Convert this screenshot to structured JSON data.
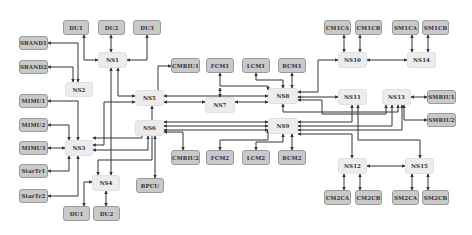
{
  "diagram": {
    "type": "network-topology",
    "colors": {
      "leaf_fill": "#c9c9c9",
      "switch_fill": "#ececec",
      "line": "#333333"
    },
    "nodes": [
      {
        "id": "DU1_top",
        "label": "DU1",
        "kind": "leaf",
        "x": 63,
        "y": 20,
        "w": 26,
        "h": 15
      },
      {
        "id": "DU2_top",
        "label": "DU2",
        "kind": "leaf",
        "x": 98,
        "y": 20,
        "w": 27,
        "h": 15
      },
      {
        "id": "DU3",
        "label": "DU3",
        "kind": "leaf",
        "x": 133,
        "y": 20,
        "w": 28,
        "h": 15
      },
      {
        "id": "SBAND1",
        "label": "SBAND1",
        "kind": "leaf",
        "x": 19,
        "y": 36,
        "w": 29,
        "h": 14
      },
      {
        "id": "SBAND2",
        "label": "SBAND2",
        "kind": "leaf",
        "x": 19,
        "y": 60,
        "w": 29,
        "h": 14
      },
      {
        "id": "NS1",
        "label": "NS1",
        "kind": "ns",
        "x": 98,
        "y": 52,
        "w": 29,
        "h": 16
      },
      {
        "id": "NS2",
        "label": "NS2",
        "kind": "ns",
        "x": 65,
        "y": 82,
        "w": 28,
        "h": 15
      },
      {
        "id": "MIMU1",
        "label": "MIMU1",
        "kind": "leaf",
        "x": 19,
        "y": 94,
        "w": 29,
        "h": 14
      },
      {
        "id": "MIMU2",
        "label": "MIMU2",
        "kind": "leaf",
        "x": 19,
        "y": 118,
        "w": 29,
        "h": 14
      },
      {
        "id": "MIMU3",
        "label": "MIMU3",
        "kind": "leaf",
        "x": 19,
        "y": 141,
        "w": 29,
        "h": 14
      },
      {
        "id": "StarTr1",
        "label": "StarTr1",
        "kind": "leaf",
        "x": 19,
        "y": 164,
        "w": 29,
        "h": 14
      },
      {
        "id": "StarTr2",
        "label": "StarTr2",
        "kind": "leaf",
        "x": 19,
        "y": 189,
        "w": 29,
        "h": 14
      },
      {
        "id": "NS3",
        "label": "NS3",
        "kind": "ns",
        "x": 65,
        "y": 140,
        "w": 28,
        "h": 16
      },
      {
        "id": "NS4",
        "label": "NS4",
        "kind": "ns",
        "x": 92,
        "y": 175,
        "w": 28,
        "h": 16
      },
      {
        "id": "DU1_bot",
        "label": "DU1",
        "kind": "leaf",
        "x": 63,
        "y": 206,
        "w": 27,
        "h": 15
      },
      {
        "id": "DU2_bot",
        "label": "DU2",
        "kind": "leaf",
        "x": 93,
        "y": 206,
        "w": 27,
        "h": 15
      },
      {
        "id": "NS5",
        "label": "NS5",
        "kind": "ns",
        "x": 135,
        "y": 90,
        "w": 29,
        "h": 16
      },
      {
        "id": "NS6",
        "label": "NS6",
        "kind": "ns",
        "x": 135,
        "y": 120,
        "w": 29,
        "h": 16
      },
      {
        "id": "BPCU",
        "label": "BPCU",
        "kind": "leaf",
        "x": 136,
        "y": 178,
        "w": 28,
        "h": 15
      },
      {
        "id": "CMRIU1",
        "label": "CMRIU1",
        "kind": "leaf",
        "x": 171,
        "y": 58,
        "w": 29,
        "h": 15
      },
      {
        "id": "CMRIU2",
        "label": "CMRIU2",
        "kind": "leaf",
        "x": 171,
        "y": 150,
        "w": 29,
        "h": 15
      },
      {
        "id": "FCM1",
        "label": "FCM1",
        "kind": "leaf",
        "x": 206,
        "y": 58,
        "w": 28,
        "h": 15
      },
      {
        "id": "LCM1",
        "label": "LCM1",
        "kind": "leaf",
        "x": 242,
        "y": 58,
        "w": 28,
        "h": 15
      },
      {
        "id": "RCM1",
        "label": "RCM1",
        "kind": "leaf",
        "x": 278,
        "y": 58,
        "w": 28,
        "h": 15
      },
      {
        "id": "NS7",
        "label": "NS7",
        "kind": "ns",
        "x": 205,
        "y": 97,
        "w": 30,
        "h": 16
      },
      {
        "id": "NS8",
        "label": "NS8",
        "kind": "ns",
        "x": 268,
        "y": 88,
        "w": 30,
        "h": 16
      },
      {
        "id": "NS9",
        "label": "NS9",
        "kind": "ns",
        "x": 268,
        "y": 118,
        "w": 30,
        "h": 16
      },
      {
        "id": "FCM2",
        "label": "FCM2",
        "kind": "leaf",
        "x": 206,
        "y": 150,
        "w": 28,
        "h": 15
      },
      {
        "id": "LCM2",
        "label": "LCM2",
        "kind": "leaf",
        "x": 242,
        "y": 150,
        "w": 28,
        "h": 15
      },
      {
        "id": "RCM2",
        "label": "RCM2",
        "kind": "leaf",
        "x": 278,
        "y": 150,
        "w": 28,
        "h": 15
      },
      {
        "id": "CM1CA",
        "label": "CM1CA",
        "kind": "leaf",
        "x": 324,
        "y": 20,
        "w": 27,
        "h": 15
      },
      {
        "id": "CM1CB",
        "label": "CM1CB",
        "kind": "leaf",
        "x": 355,
        "y": 20,
        "w": 27,
        "h": 15
      },
      {
        "id": "SM1CA",
        "label": "SM1CA",
        "kind": "leaf",
        "x": 392,
        "y": 20,
        "w": 27,
        "h": 15
      },
      {
        "id": "SM1CB",
        "label": "SM1CB",
        "kind": "leaf",
        "x": 422,
        "y": 20,
        "w": 27,
        "h": 15
      },
      {
        "id": "NS10",
        "label": "NS10",
        "kind": "ns",
        "x": 338,
        "y": 52,
        "w": 29,
        "h": 16
      },
      {
        "id": "NS14",
        "label": "NS14",
        "kind": "ns",
        "x": 407,
        "y": 52,
        "w": 29,
        "h": 16
      },
      {
        "id": "NS11",
        "label": "NS11",
        "kind": "ns",
        "x": 338,
        "y": 89,
        "w": 29,
        "h": 16
      },
      {
        "id": "NS13",
        "label": "NS13",
        "kind": "ns",
        "x": 382,
        "y": 89,
        "w": 29,
        "h": 16
      },
      {
        "id": "SMRIU1",
        "label": "SMRIU1",
        "kind": "leaf",
        "x": 427,
        "y": 90,
        "w": 29,
        "h": 14
      },
      {
        "id": "SMRIU2",
        "label": "SMRIU2",
        "kind": "leaf",
        "x": 427,
        "y": 113,
        "w": 29,
        "h": 14
      },
      {
        "id": "NS12",
        "label": "NS12",
        "kind": "ns",
        "x": 338,
        "y": 158,
        "w": 29,
        "h": 16
      },
      {
        "id": "NS15",
        "label": "NS15",
        "kind": "ns",
        "x": 405,
        "y": 158,
        "w": 29,
        "h": 16
      },
      {
        "id": "CM2CA",
        "label": "CM2CA",
        "kind": "leaf",
        "x": 324,
        "y": 190,
        "w": 27,
        "h": 15
      },
      {
        "id": "CM2CB",
        "label": "CM2CB",
        "kind": "leaf",
        "x": 355,
        "y": 190,
        "w": 27,
        "h": 15
      },
      {
        "id": "SM2CA",
        "label": "SM2CA",
        "kind": "leaf",
        "x": 392,
        "y": 190,
        "w": 27,
        "h": 15
      },
      {
        "id": "SM2CB",
        "label": "SM2CB",
        "kind": "leaf",
        "x": 422,
        "y": 190,
        "w": 27,
        "h": 15
      }
    ],
    "edges": [
      {
        "points": [
          [
            84,
            35
          ],
          [
            84,
            60
          ],
          [
            98,
            60
          ]
        ]
      },
      {
        "points": [
          [
            111,
            35
          ],
          [
            111,
            52
          ]
        ]
      },
      {
        "points": [
          [
            147,
            35
          ],
          [
            147,
            60
          ],
          [
            127,
            60
          ]
        ]
      },
      {
        "points": [
          [
            48,
            43
          ],
          [
            78,
            43
          ],
          [
            78,
            82
          ]
        ]
      },
      {
        "points": [
          [
            48,
            67
          ],
          [
            73,
            67
          ],
          [
            73,
            82
          ]
        ]
      },
      {
        "points": [
          [
            48,
            101
          ],
          [
            78,
            101
          ],
          [
            78,
            140
          ]
        ]
      },
      {
        "points": [
          [
            48,
            125
          ],
          [
            69,
            125
          ],
          [
            69,
            140
          ]
        ]
      },
      {
        "points": [
          [
            48,
            148
          ],
          [
            65,
            148
          ]
        ]
      },
      {
        "points": [
          [
            48,
            171
          ],
          [
            69,
            171
          ],
          [
            69,
            156
          ]
        ]
      },
      {
        "points": [
          [
            48,
            196
          ],
          [
            78,
            196
          ],
          [
            78,
            156
          ]
        ]
      },
      {
        "points": [
          [
            84,
            206
          ],
          [
            84,
            182
          ],
          [
            92,
            182
          ]
        ]
      },
      {
        "points": [
          [
            106,
            206
          ],
          [
            106,
            191
          ]
        ]
      },
      {
        "points": [
          [
            118,
            68
          ],
          [
            118,
            96
          ],
          [
            135,
            96
          ]
        ]
      },
      {
        "points": [
          [
            111,
            68
          ],
          [
            111,
            175
          ]
        ]
      },
      {
        "points": [
          [
            93,
            145
          ],
          [
            104,
            145
          ],
          [
            104,
            102
          ],
          [
            135,
            102
          ]
        ]
      },
      {
        "points": [
          [
            93,
            150
          ],
          [
            148,
            150
          ],
          [
            148,
            136
          ]
        ]
      },
      {
        "points": [
          [
            93,
            138
          ],
          [
            142,
            138
          ],
          [
            142,
            126
          ],
          [
            135,
            126
          ]
        ]
      },
      {
        "points": [
          [
            98,
            175
          ],
          [
            98,
            160
          ],
          [
            152,
            160
          ],
          [
            152,
            106
          ]
        ]
      },
      {
        "points": [
          [
            155,
            178
          ],
          [
            155,
            136
          ]
        ]
      },
      {
        "points": [
          [
            164,
            94
          ],
          [
            158,
            94
          ],
          [
            158,
            66
          ],
          [
            171,
            66
          ]
        ]
      },
      {
        "points": [
          [
            164,
            132
          ],
          [
            183,
            132
          ],
          [
            183,
            150
          ]
        ]
      },
      {
        "points": [
          [
            164,
            96
          ],
          [
            268,
            96
          ]
        ]
      },
      {
        "points": [
          [
            164,
            102
          ],
          [
            205,
            102
          ]
        ]
      },
      {
        "points": [
          [
            164,
            122
          ],
          [
            268,
            122
          ]
        ]
      },
      {
        "points": [
          [
            164,
            126
          ],
          [
            268,
            126
          ]
        ]
      },
      {
        "points": [
          [
            164,
            130
          ],
          [
            268,
            130
          ]
        ]
      },
      {
        "points": [
          [
            235,
            102
          ],
          [
            268,
            102
          ]
        ]
      },
      {
        "points": [
          [
            220,
            73
          ],
          [
            220,
            86
          ],
          [
            268,
            86
          ],
          [
            268,
            90
          ]
        ]
      },
      {
        "points": [
          [
            256,
            73
          ],
          [
            256,
            80
          ],
          [
            283,
            80
          ],
          [
            283,
            88
          ]
        ]
      },
      {
        "points": [
          [
            292,
            73
          ],
          [
            292,
            88
          ]
        ]
      },
      {
        "points": [
          [
            220,
            150
          ],
          [
            220,
            140
          ],
          [
            268,
            140
          ],
          [
            268,
            130
          ]
        ]
      },
      {
        "points": [
          [
            256,
            150
          ],
          [
            256,
            142
          ],
          [
            283,
            142
          ],
          [
            283,
            134
          ]
        ]
      },
      {
        "points": [
          [
            292,
            150
          ],
          [
            292,
            134
          ]
        ]
      },
      {
        "points": [
          [
            220,
            97
          ],
          [
            220,
            88
          ]
        ]
      },
      {
        "points": [
          [
            298,
            92
          ],
          [
            318,
            92
          ],
          [
            318,
            60
          ],
          [
            338,
            60
          ]
        ]
      },
      {
        "points": [
          [
            298,
            97
          ],
          [
            338,
            97
          ]
        ]
      },
      {
        "points": [
          [
            298,
            100
          ],
          [
            322,
            100
          ],
          [
            322,
            114
          ],
          [
            386,
            114
          ],
          [
            386,
            105
          ]
        ]
      },
      {
        "points": [
          [
            298,
            122
          ],
          [
            352,
            122
          ],
          [
            352,
            105
          ]
        ]
      },
      {
        "points": [
          [
            298,
            126
          ],
          [
            392,
            126
          ],
          [
            392,
            105
          ]
        ]
      },
      {
        "points": [
          [
            298,
            130
          ],
          [
            402,
            130
          ],
          [
            402,
            105
          ]
        ]
      },
      {
        "points": [
          [
            298,
            134
          ],
          [
            352,
            134
          ],
          [
            352,
            158
          ]
        ]
      },
      {
        "points": [
          [
            358,
            105
          ],
          [
            358,
            140
          ],
          [
            420,
            140
          ],
          [
            420,
            158
          ]
        ]
      },
      {
        "points": [
          [
            283,
            104
          ],
          [
            283,
            112
          ],
          [
            398,
            112
          ],
          [
            398,
            105
          ]
        ]
      },
      {
        "points": [
          [
            367,
            60
          ],
          [
            407,
            60
          ]
        ]
      },
      {
        "points": [
          [
            367,
            166
          ],
          [
            405,
            166
          ]
        ]
      },
      {
        "points": [
          [
            411,
            97
          ],
          [
            427,
            97
          ]
        ]
      },
      {
        "points": [
          [
            404,
            105
          ],
          [
            404,
            120
          ],
          [
            427,
            120
          ]
        ]
      },
      {
        "points": [
          [
            344,
            35
          ],
          [
            344,
            52
          ]
        ]
      },
      {
        "points": [
          [
            360,
            35
          ],
          [
            360,
            52
          ]
        ]
      },
      {
        "points": [
          [
            412,
            35
          ],
          [
            412,
            52
          ]
        ]
      },
      {
        "points": [
          [
            428,
            35
          ],
          [
            428,
            52
          ]
        ]
      },
      {
        "points": [
          [
            344,
            174
          ],
          [
            344,
            190
          ]
        ]
      },
      {
        "points": [
          [
            360,
            174
          ],
          [
            360,
            190
          ]
        ]
      },
      {
        "points": [
          [
            412,
            174
          ],
          [
            412,
            190
          ]
        ]
      },
      {
        "points": [
          [
            428,
            174
          ],
          [
            428,
            190
          ]
        ]
      }
    ]
  }
}
